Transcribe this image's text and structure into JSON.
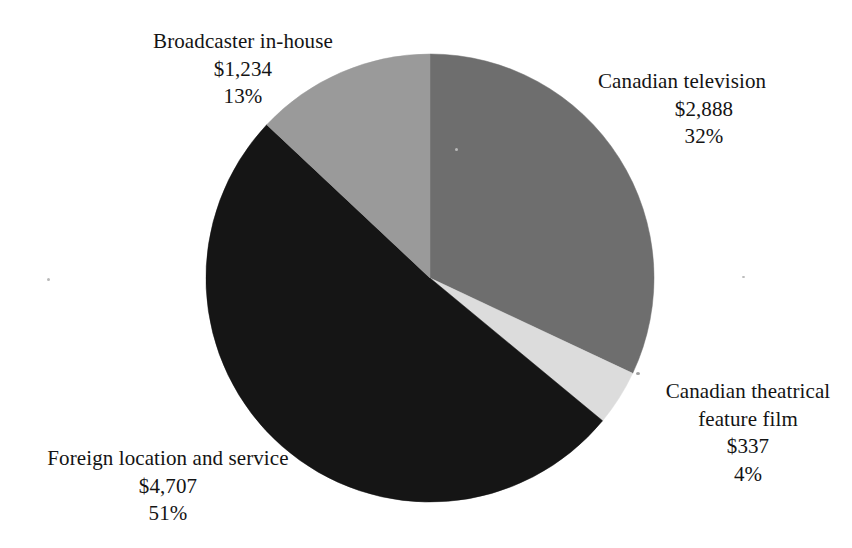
{
  "chart_data": {
    "type": "pie",
    "title": "",
    "subtitle": "",
    "xlabel": "",
    "ylabel": "",
    "legend_position": "none",
    "grid": false,
    "value_prefix": "$",
    "total_value": 9166,
    "units": "millions of dollars",
    "start_angle_deg": 0,
    "direction": "clockwise",
    "categories": [
      "Canadian television",
      "Canadian theatrical feature film",
      "Foreign location and service",
      "Broadcaster in-house"
    ],
    "values": [
      2888,
      337,
      4707,
      1234
    ],
    "percents": [
      32,
      4,
      51,
      13
    ],
    "colors": [
      "#6e6e6e",
      "#dcdcdc",
      "#151515",
      "#9a9a9a"
    ],
    "slices": [
      {
        "name": "Canadian television",
        "value": 2888,
        "value_label": "$2,888",
        "percent": 32,
        "percent_label": "32%",
        "color": "#6e6e6e",
        "start_deg": 0,
        "end_deg": 115.2
      },
      {
        "name": "Canadian theatrical feature film",
        "value": 337,
        "value_label": "$337",
        "percent": 4,
        "percent_label": "4%",
        "color": "#dcdcdc",
        "start_deg": 115.2,
        "end_deg": 129.6
      },
      {
        "name": "Foreign location and service",
        "value": 4707,
        "value_label": "$4,707",
        "percent": 51,
        "percent_label": "51%",
        "color": "#151515",
        "start_deg": 129.6,
        "end_deg": 313.2
      },
      {
        "name": "Broadcaster in-house",
        "value": 1234,
        "value_label": "$1,234",
        "percent": 13,
        "percent_label": "13%",
        "color": "#9a9a9a",
        "start_deg": 313.2,
        "end_deg": 360
      }
    ]
  },
  "labels": {
    "broadcaster": {
      "title": "Broadcaster in-house",
      "amount": "$1,234",
      "percent": "13%"
    },
    "television": {
      "title": "Canadian television",
      "amount": "$2,888",
      "percent": "32%"
    },
    "theatrical": {
      "title_line1": "Canadian theatrical",
      "title_line2": "feature film",
      "amount": "$337",
      "percent": "4%"
    },
    "foreign": {
      "title": "Foreign location and service",
      "amount": "$4,707",
      "percent": "51%"
    }
  }
}
